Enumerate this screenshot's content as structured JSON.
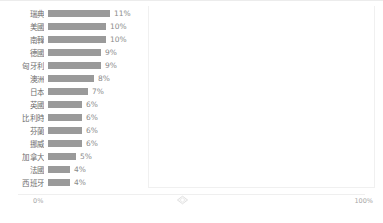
{
  "chart_data": {
    "type": "bar",
    "orientation": "horizontal",
    "title": "",
    "xlabel": "",
    "ylabel": "",
    "grid": false,
    "legend": null,
    "xlim": [
      0,
      100
    ],
    "axis": {
      "min_label": "0%",
      "max_label": "100%",
      "handle_icon": "diamond-marker-icon"
    },
    "categories": [
      "瑞典",
      "美國",
      "南韓",
      "德國",
      "匈牙利",
      "澳洲",
      "日本",
      "英國",
      "比利時",
      "芬蘭",
      "挪威",
      "加拿大",
      "法國",
      "西班牙"
    ],
    "values": [
      11,
      10,
      10,
      9,
      9,
      8,
      7,
      6,
      6,
      6,
      6,
      5,
      4,
      4
    ],
    "value_labels": [
      "11%",
      "10%",
      "10%",
      "9%",
      "9%",
      "8%",
      "7%",
      "6%",
      "6%",
      "6%",
      "6%",
      "5%",
      "4%",
      "4%"
    ],
    "bar_color": "#9a9a9a",
    "bar_pixel_widths": [
      62,
      58,
      58,
      53,
      53,
      46,
      40,
      34,
      34,
      34,
      34,
      28,
      22,
      22
    ]
  },
  "footer": {
    "credit": ""
  }
}
